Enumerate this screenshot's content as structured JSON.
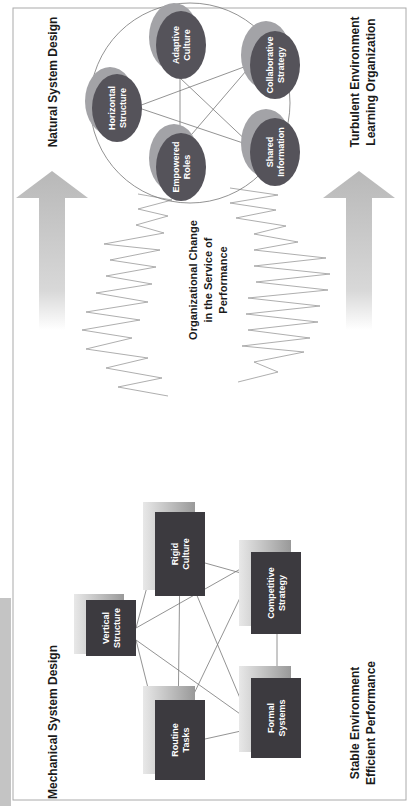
{
  "diagram": {
    "left_side": {
      "title": "Mechanical System Design",
      "footer_lines": [
        "Stable Environment",
        "Efficient Performance"
      ],
      "nodes": [
        {
          "id": "vertical-structure",
          "lines": [
            "Vertical",
            "Structure"
          ]
        },
        {
          "id": "rigid-culture",
          "lines": [
            "Rigid",
            "Culture"
          ]
        },
        {
          "id": "routine-tasks",
          "lines": [
            "Routine",
            "Tasks"
          ]
        },
        {
          "id": "competitive-strategy",
          "lines": [
            "Competitive",
            "Strategy"
          ]
        },
        {
          "id": "formal-systems",
          "lines": [
            "Formal",
            "Systems"
          ]
        }
      ]
    },
    "center": {
      "lines": [
        "Organizational Change",
        "in the Service of",
        "Performance"
      ]
    },
    "right_side": {
      "title": "Natural System Design",
      "footer_lines": [
        "Turbulent Environment",
        "Learning Organization"
      ],
      "nodes": [
        {
          "id": "horizontal-structure",
          "lines": [
            "Horizontal",
            "Structure"
          ]
        },
        {
          "id": "adaptive-culture",
          "lines": [
            "Adaptive",
            "Culture"
          ]
        },
        {
          "id": "collaborative-strategy",
          "lines": [
            "Collaborative",
            "Strategy"
          ]
        },
        {
          "id": "empowered-roles",
          "lines": [
            "Empowered",
            "Roles"
          ]
        },
        {
          "id": "shared-information",
          "lines": [
            "Shared",
            "Information"
          ]
        }
      ]
    },
    "colors": {
      "box_fill": "#3c3a3f",
      "ellipse_fill": "#55535a",
      "shadow": "#8a8a8a",
      "line": "#6e6e6e",
      "arrow": "#bcbcbc"
    }
  }
}
